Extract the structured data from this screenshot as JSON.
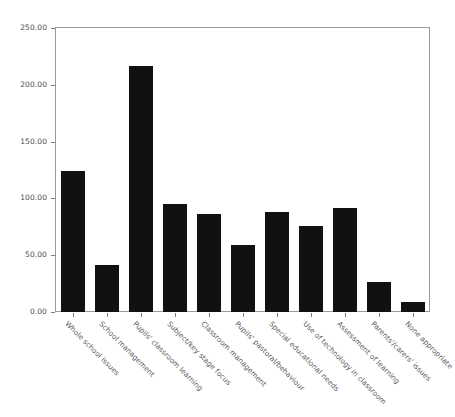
{
  "chart_data": {
    "type": "bar",
    "title": "",
    "subtitle": "",
    "xlabel": "",
    "ylabel": "",
    "ylim": [
      0,
      250
    ],
    "grid": false,
    "legend": "none",
    "bar_color": "#111111",
    "axis_color": "#9a9a9a",
    "tick_label_color": "#4c4c4c",
    "categories": [
      "Whole school issues",
      "School management",
      "Pupils' classroom learning",
      "Subject/key stage focus",
      "Classroom management",
      "Pupils' pastoral/behaviour",
      "Special educational needs",
      "Use of technology in classroom",
      "Assessment of learning",
      "Parents'/carers' issues",
      "None appropriate"
    ],
    "values": [
      124,
      41,
      217,
      95,
      86,
      59,
      88,
      76,
      92,
      26,
      9
    ],
    "ytick_values": [
      0,
      50,
      100,
      150,
      200,
      250
    ],
    "ytick_labels": [
      "0.00",
      "50.00",
      "100.00",
      "150.00",
      "200.00",
      "250.00"
    ]
  }
}
